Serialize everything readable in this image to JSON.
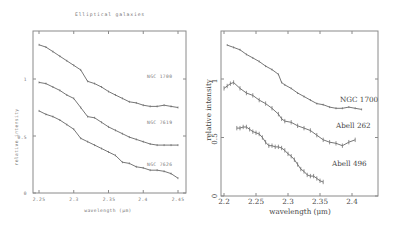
{
  "chart_data": [
    {
      "type": "line",
      "title": "Elliptical galaxies",
      "xlabel": "wavelength (μm)",
      "ylabel": "relative intensity",
      "xlim": [
        2.24,
        2.46
      ],
      "ylim": [
        0,
        1.5
      ],
      "xticks": [
        "2.25",
        "2.3",
        "2.35",
        "2.4",
        "2.45"
      ],
      "yticks": [
        "0",
        "0.5",
        "1"
      ],
      "grid": false,
      "legend_position": "inline labels at right end of curves",
      "series": [
        {
          "name": "NGC 1700",
          "x": [
            2.25,
            2.26,
            2.27,
            2.28,
            2.29,
            2.3,
            2.31,
            2.32,
            2.33,
            2.34,
            2.35,
            2.36,
            2.37,
            2.38,
            2.39,
            2.4,
            2.41,
            2.42,
            2.43,
            2.44,
            2.45
          ],
          "y": [
            1.3,
            1.28,
            1.24,
            1.2,
            1.16,
            1.12,
            1.08,
            0.98,
            0.96,
            0.93,
            0.89,
            0.86,
            0.83,
            0.8,
            0.79,
            0.77,
            0.76,
            0.76,
            0.77,
            0.76,
            0.75
          ]
        },
        {
          "name": "NGC 7619",
          "x": [
            2.25,
            2.26,
            2.27,
            2.28,
            2.29,
            2.3,
            2.31,
            2.32,
            2.33,
            2.34,
            2.35,
            2.36,
            2.37,
            2.38,
            2.39,
            2.4,
            2.41,
            2.42,
            2.43,
            2.44,
            2.45
          ],
          "y": [
            0.97,
            0.96,
            0.93,
            0.9,
            0.86,
            0.83,
            0.75,
            0.67,
            0.66,
            0.62,
            0.58,
            0.55,
            0.52,
            0.49,
            0.47,
            0.45,
            0.43,
            0.42,
            0.42,
            0.42,
            0.42
          ]
        },
        {
          "name": "NGC 7626",
          "x": [
            2.25,
            2.26,
            2.27,
            2.28,
            2.29,
            2.3,
            2.31,
            2.32,
            2.33,
            2.34,
            2.35,
            2.36,
            2.37,
            2.38,
            2.39,
            2.4,
            2.41,
            2.42,
            2.43,
            2.44,
            2.45
          ],
          "y": [
            0.72,
            0.69,
            0.67,
            0.64,
            0.6,
            0.56,
            0.48,
            0.45,
            0.42,
            0.39,
            0.36,
            0.33,
            0.27,
            0.26,
            0.23,
            0.22,
            0.2,
            0.2,
            0.19,
            0.17,
            0.13
          ]
        }
      ]
    },
    {
      "type": "line",
      "title": "",
      "xlabel": "wavelength (μm)",
      "ylabel": "relative intensity",
      "xlim": [
        2.2,
        2.42
      ],
      "ylim": [
        0,
        1.4
      ],
      "xticks": [
        "2.2",
        "2.25",
        "2.3",
        "2.35",
        "2.4"
      ],
      "yticks": [
        "0",
        "0.5",
        "1"
      ],
      "grid": false,
      "legend_position": "inline labels at right end of curves",
      "series": [
        {
          "name": "NGC 1700",
          "x": [
            2.205,
            2.215,
            2.225,
            2.235,
            2.245,
            2.255,
            2.265,
            2.275,
            2.285,
            2.29,
            2.295,
            2.305,
            2.315,
            2.325,
            2.335,
            2.345,
            2.355,
            2.365,
            2.375,
            2.385,
            2.395,
            2.405,
            2.415
          ],
          "y": [
            1.29,
            1.27,
            1.25,
            1.21,
            1.18,
            1.15,
            1.11,
            1.08,
            1.04,
            0.97,
            0.95,
            0.92,
            0.88,
            0.85,
            0.82,
            0.79,
            0.78,
            0.76,
            0.75,
            0.75,
            0.76,
            0.75,
            0.74
          ]
        },
        {
          "name": "Abell 262",
          "x": [
            2.2,
            2.205,
            2.21,
            2.215,
            2.225,
            2.235,
            2.245,
            2.255,
            2.265,
            2.275,
            2.285,
            2.29,
            2.295,
            2.305,
            2.315,
            2.325,
            2.335,
            2.345,
            2.355,
            2.365,
            2.375,
            2.385,
            2.395,
            2.405
          ],
          "y": [
            0.92,
            0.94,
            0.96,
            0.97,
            0.92,
            0.88,
            0.86,
            0.82,
            0.79,
            0.75,
            0.7,
            0.66,
            0.64,
            0.63,
            0.6,
            0.58,
            0.56,
            0.52,
            0.48,
            0.46,
            0.45,
            0.43,
            0.46,
            0.48
          ]
        },
        {
          "name": "Abell 496",
          "x": [
            2.22,
            2.225,
            2.23,
            2.235,
            2.24,
            2.245,
            2.25,
            2.255,
            2.26,
            2.265,
            2.27,
            2.275,
            2.28,
            2.285,
            2.29,
            2.295,
            2.3,
            2.305,
            2.31,
            2.315,
            2.32,
            2.325,
            2.33,
            2.335,
            2.34,
            2.345,
            2.35,
            2.355,
            2.36,
            2.365,
            2.37
          ],
          "y": [
            0.58,
            0.58,
            0.59,
            0.59,
            0.57,
            0.55,
            0.54,
            0.53,
            0.5,
            0.46,
            0.43,
            0.43,
            0.42,
            0.42,
            0.41,
            0.39,
            0.36,
            0.34,
            0.31,
            0.27,
            0.23,
            0.21,
            0.18,
            0.17,
            0.17,
            0.15,
            0.13,
            0.12
          ]
        }
      ]
    }
  ],
  "left_chart": {
    "title": "Elliptical galaxies",
    "xlabel": "wavelength (μm)",
    "ylabel": "relative intensity",
    "xticks": [
      "2.25",
      "2.3",
      "2.35",
      "2.4",
      "2.45"
    ],
    "yticks": [
      "1",
      "0.5",
      "0"
    ],
    "labels": [
      "NGC 1700",
      "NGC 7619",
      "NGC 7626"
    ]
  },
  "right_chart": {
    "xlabel": "wavelength (μm)",
    "ylabel": "relative intensity",
    "xticks": [
      "2.2",
      "2.25",
      "2.3",
      "2.35",
      "2.4"
    ],
    "yticks": [
      "1",
      "0.5",
      "0"
    ],
    "labels": [
      "NGC 1700",
      "Abell 262",
      "Abell 496"
    ]
  }
}
